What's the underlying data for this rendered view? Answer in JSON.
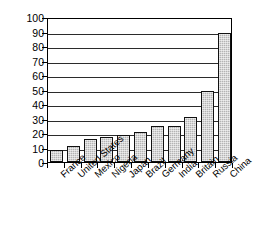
{
  "chart_data": {
    "type": "bar",
    "title": "",
    "xlabel": "",
    "ylabel": "Union Membership (%)",
    "ylim": [
      0,
      100
    ],
    "ytick_step": 10,
    "yticks": [
      0,
      10,
      20,
      30,
      40,
      50,
      60,
      70,
      80,
      90,
      100
    ],
    "grid": "horizontal",
    "legend": "none",
    "bar_fill_color": "#b4b4b4",
    "bar_edge_color": "#111111",
    "axis_color": "#000000",
    "background_color": "#ffffff",
    "categories": [
      "France",
      "United States",
      "Mexico",
      "Nigeria",
      "Japan",
      "Brazil",
      "Germany",
      "India",
      "Britain",
      "Russia",
      "China"
    ],
    "values": [
      8,
      11,
      16,
      17,
      18.5,
      20.5,
      25,
      25,
      31,
      49,
      89
    ]
  }
}
